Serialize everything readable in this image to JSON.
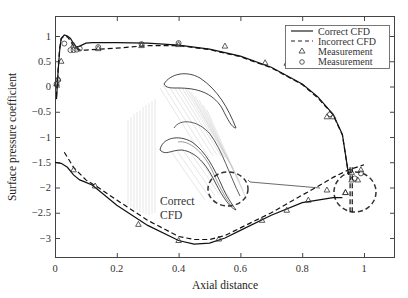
{
  "chart_data": {
    "type": "line",
    "title": "",
    "xlabel": "Axial distance",
    "ylabel": "Surface pressure coefficient",
    "xlim": [
      0,
      1.1
    ],
    "ylim": [
      -3.38,
      1.4
    ],
    "xticks": [
      0,
      0.2,
      0.4,
      0.6,
      0.8,
      1
    ],
    "xtick_labels": [
      "0",
      "0.2",
      "0.4",
      "0.6",
      "0.8",
      "1"
    ],
    "yticks": [
      1,
      0.5,
      0,
      -0.5,
      -1,
      -1.5,
      -2,
      -2.5,
      -3
    ],
    "ytick_labels": [
      "1",
      "0.5",
      "0",
      "−0.5",
      "−1",
      "−1.5",
      "−2",
      "−2.5",
      "−3"
    ],
    "grid": false,
    "legend_position": "upper right",
    "legend": [
      {
        "label": "Correct CFD",
        "style": "solid-line"
      },
      {
        "label": "Incorrect CFD",
        "style": "dashed-line"
      },
      {
        "label": "Measurement",
        "style": "triangle-marker"
      },
      {
        "label": "Measurement",
        "style": "circle-marker"
      }
    ],
    "series": [
      {
        "name": "Correct CFD (suction side)",
        "style": "solid",
        "x": [
          0.005,
          0.01,
          0.015,
          0.02,
          0.03,
          0.04,
          0.05,
          0.06,
          0.07,
          0.08,
          0.1,
          0.12,
          0.2,
          0.3,
          0.4,
          0.5,
          0.6,
          0.7,
          0.8,
          0.85,
          0.9,
          0.93,
          0.95
        ],
        "y": [
          -0.25,
          0.3,
          0.7,
          0.95,
          1.02,
          1.0,
          0.95,
          0.85,
          0.78,
          0.8,
          0.86,
          0.87,
          0.87,
          0.86,
          0.82,
          0.74,
          0.6,
          0.38,
          0.05,
          -0.2,
          -0.55,
          -0.95,
          -1.75
        ]
      },
      {
        "name": "Incorrect CFD (suction side)",
        "style": "dashed",
        "x": [
          0.005,
          0.01,
          0.015,
          0.02,
          0.03,
          0.04,
          0.05,
          0.06,
          0.08,
          0.1,
          0.2,
          0.3,
          0.4,
          0.5,
          0.6,
          0.7,
          0.8,
          0.85,
          0.9,
          0.93,
          0.95
        ],
        "y": [
          -0.2,
          0.35,
          0.75,
          0.95,
          1.0,
          0.98,
          0.9,
          0.8,
          0.72,
          0.72,
          0.76,
          0.81,
          0.81,
          0.73,
          0.59,
          0.37,
          0.04,
          -0.22,
          -0.56,
          -0.96,
          -1.75
        ]
      },
      {
        "name": "Correct CFD (pressure side)",
        "style": "solid",
        "x": [
          0.0,
          0.02,
          0.04,
          0.06,
          0.08,
          0.1,
          0.12,
          0.14,
          0.2,
          0.3,
          0.4,
          0.45,
          0.5,
          0.55,
          0.6,
          0.7,
          0.8,
          0.85,
          0.9,
          0.93
        ],
        "y": [
          -1.5,
          -1.52,
          -1.6,
          -1.75,
          -1.85,
          -1.9,
          -1.95,
          -2.05,
          -2.35,
          -2.75,
          -3.05,
          -3.12,
          -3.1,
          -3.0,
          -2.85,
          -2.55,
          -2.3,
          -2.25,
          -2.2,
          -2.2
        ]
      },
      {
        "name": "Incorrect CFD (pressure side)",
        "style": "dashed",
        "x": [
          0.03,
          0.06,
          0.1,
          0.14,
          0.2,
          0.3,
          0.4,
          0.45,
          0.5,
          0.55,
          0.6,
          0.7,
          0.8,
          0.85,
          0.9,
          0.95,
          1.0
        ],
        "y": [
          -1.3,
          -1.6,
          -1.85,
          -2.0,
          -2.25,
          -2.65,
          -2.97,
          -3.03,
          -3.03,
          -2.95,
          -2.8,
          -2.5,
          -2.15,
          -1.98,
          -1.8,
          -1.65,
          -1.55
        ]
      },
      {
        "name": "Measurement (triangle)",
        "style": "triangle",
        "x": [
          0.005,
          0.01,
          0.02,
          0.06,
          0.14,
          0.28,
          0.4,
          0.55,
          0.68,
          0.75,
          0.82,
          0.88,
          0.9,
          0.94,
          0.96,
          0.98,
          0.99,
          0.06,
          0.13,
          0.27,
          0.4,
          0.53,
          0.67,
          0.75,
          0.82,
          0.88,
          0.94,
          0.96
        ],
        "y": [
          0.05,
          0.15,
          0.5,
          0.82,
          0.75,
          0.81,
          0.83,
          0.8,
          0.47,
          0.46,
          0.47,
          -0.6,
          -0.6,
          -2.1,
          -1.7,
          -1.85,
          -1.65,
          -1.65,
          -1.97,
          -2.73,
          -3.05,
          -3.02,
          -2.65,
          -2.45,
          -2.25,
          -2.05,
          -2.1,
          -1.85
        ]
      },
      {
        "name": "Measurement (circle)",
        "style": "circle",
        "x": [
          0.005,
          0.01,
          0.03,
          0.05,
          0.06,
          0.07,
          0.08,
          0.14,
          0.28,
          0.4,
          0.89,
          0.97,
          0.99
        ],
        "y": [
          0.05,
          0.13,
          0.85,
          0.72,
          0.72,
          0.73,
          0.75,
          0.78,
          0.84,
          0.86,
          -0.55,
          -1.82,
          -1.72
        ]
      }
    ],
    "annotations": [
      {
        "text": "Correct CFD",
        "type": "inset-label"
      },
      {
        "text": "",
        "type": "dashed-ellipse",
        "note": "trailing-edge region near x=0.95"
      }
    ],
    "inset": "Turbine blade passage flow visualization (streamlines)"
  }
}
